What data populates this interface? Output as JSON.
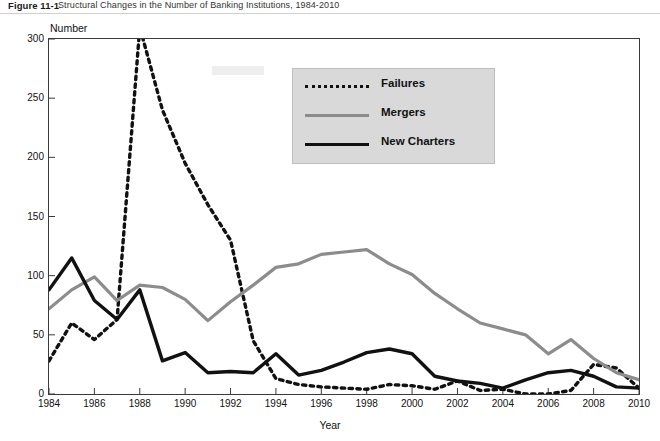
{
  "caption": {
    "number": "Figure 11-1",
    "text": "Structural Changes in the Number of Banking Institutions, 1984-2010"
  },
  "axes": {
    "ylabel": "Number",
    "xlabel": "Year",
    "yticks": [
      "0",
      "50",
      "100",
      "150",
      "200",
      "250",
      "300"
    ],
    "xticks": [
      "1984",
      "1986",
      "1988",
      "1990",
      "1992",
      "1994",
      "1996",
      "1998",
      "2000",
      "2002",
      "2004",
      "2006",
      "2008",
      "2010"
    ]
  },
  "legend": {
    "items": [
      {
        "label": "Failures",
        "style": "dotted",
        "color": "#111111"
      },
      {
        "label": "Mergers",
        "style": "solid",
        "color": "#8c8c8c"
      },
      {
        "label": "New Charters",
        "style": "solid",
        "color": "#111111"
      }
    ]
  },
  "chart_data": {
    "type": "line",
    "title": "Structural Changes in the Number of Banking Institutions, 1984-2010",
    "xlabel": "Year",
    "ylabel": "Number",
    "xlim": [
      1984,
      2010
    ],
    "ylim": [
      0,
      300
    ],
    "yticks": [
      0,
      50,
      100,
      150,
      200,
      250,
      300
    ],
    "xticks": [
      1984,
      1986,
      1988,
      1990,
      1992,
      1994,
      1996,
      1998,
      2000,
      2002,
      2004,
      2006,
      2008,
      2010
    ],
    "grid": false,
    "legend_position": "inside-top-center",
    "x": [
      1984,
      1985,
      1986,
      1987,
      1988,
      1989,
      1990,
      1991,
      1992,
      1993,
      1994,
      1995,
      1996,
      1997,
      1998,
      1999,
      2000,
      2001,
      2002,
      2003,
      2004,
      2005,
      2006,
      2007,
      2008,
      2009,
      2010
    ],
    "series": [
      {
        "name": "Failures",
        "style": "dotted",
        "color": "#111111",
        "values": [
          28,
          60,
          46,
          63,
          310,
          240,
          195,
          160,
          130,
          45,
          13,
          8,
          6,
          5,
          4,
          8,
          7,
          4,
          11,
          3,
          4,
          0,
          0,
          3,
          25,
          22,
          5
        ]
      },
      {
        "name": "Mergers",
        "style": "solid",
        "color": "#8c8c8c",
        "values": [
          72,
          88,
          99,
          79,
          92,
          90,
          80,
          62,
          78,
          92,
          107,
          110,
          118,
          120,
          122,
          110,
          101,
          85,
          72,
          60,
          55,
          50,
          34,
          46,
          30,
          18,
          12
        ]
      },
      {
        "name": "New Charters",
        "style": "solid",
        "color": "#111111",
        "values": [
          88,
          115,
          79,
          63,
          88,
          28,
          35,
          18,
          19,
          18,
          34,
          16,
          20,
          27,
          35,
          38,
          34,
          15,
          11,
          9,
          5,
          12,
          18,
          20,
          15,
          6,
          5
        ]
      }
    ]
  }
}
